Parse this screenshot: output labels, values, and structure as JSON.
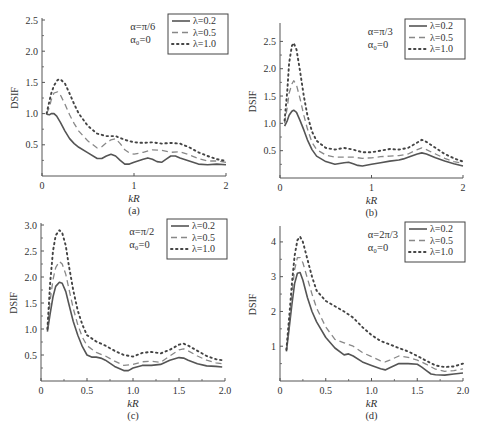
{
  "figure": {
    "background": "#ffffff",
    "axis_color": "#555555",
    "text_color": "#333333",
    "series_styles": [
      {
        "name": "λ=0.2",
        "color": "#555555",
        "dash": "",
        "width": 1.6
      },
      {
        "name": "λ=0.5",
        "color": "#888888",
        "dash": "6 4",
        "width": 1.3
      },
      {
        "name": "λ=1.0",
        "color": "#444444",
        "dash": "1.5 3.5",
        "width": 1.9
      }
    ]
  },
  "chart_data": [
    {
      "type": "line",
      "panel_label": "(a)",
      "title": "",
      "annotation": [
        "α=π/6",
        "α₀=0"
      ],
      "xlabel": "kR",
      "ylabel": "DSIF",
      "xlim": [
        0,
        2
      ],
      "ylim": [
        0,
        2.5
      ],
      "xticks": [
        0,
        1,
        2
      ],
      "xticklabels": [
        "0",
        "1",
        "2"
      ],
      "xminorticks": [],
      "yticks": [
        0.5,
        1.0,
        1.5,
        2.0,
        2.5
      ],
      "yticklabels": [
        "0.5",
        "1.0",
        "1.5",
        "2.0",
        "2.5"
      ],
      "show_y_zero_label": false,
      "grid": false,
      "legend_position": "upper right",
      "box": {
        "x": 42,
        "y": 20,
        "w": 184,
        "h": 156
      },
      "series": [
        {
          "name": "λ=0.2",
          "x": [
            0.05,
            0.08,
            0.1,
            0.13,
            0.16,
            0.2,
            0.25,
            0.3,
            0.35,
            0.4,
            0.5,
            0.6,
            0.65,
            0.7,
            0.75,
            0.8,
            0.85,
            0.9,
            0.95,
            1.0,
            1.1,
            1.15,
            1.2,
            1.25,
            1.3,
            1.35,
            1.4,
            1.45,
            1.5,
            1.6,
            1.7,
            1.8,
            1.9,
            2.0
          ],
          "y": [
            0.99,
            0.98,
            1.0,
            1.0,
            0.96,
            0.86,
            0.72,
            0.6,
            0.52,
            0.46,
            0.37,
            0.28,
            0.28,
            0.32,
            0.35,
            0.32,
            0.25,
            0.19,
            0.19,
            0.22,
            0.27,
            0.29,
            0.27,
            0.23,
            0.22,
            0.27,
            0.32,
            0.32,
            0.29,
            0.24,
            0.19,
            0.18,
            0.19,
            0.18
          ]
        },
        {
          "name": "λ=0.5",
          "x": [
            0.05,
            0.08,
            0.1,
            0.13,
            0.17,
            0.2,
            0.25,
            0.3,
            0.35,
            0.4,
            0.5,
            0.6,
            0.65,
            0.7,
            0.75,
            0.8,
            0.85,
            0.9,
            0.95,
            1.0,
            1.1,
            1.2,
            1.3,
            1.4,
            1.5,
            1.6,
            1.7,
            1.8,
            1.9,
            2.0
          ],
          "y": [
            1.0,
            1.1,
            1.22,
            1.33,
            1.35,
            1.3,
            1.15,
            0.98,
            0.84,
            0.72,
            0.56,
            0.45,
            0.47,
            0.53,
            0.58,
            0.6,
            0.52,
            0.42,
            0.37,
            0.35,
            0.38,
            0.42,
            0.41,
            0.38,
            0.39,
            0.34,
            0.28,
            0.24,
            0.24,
            0.22
          ]
        },
        {
          "name": "λ=1.0",
          "x": [
            0.05,
            0.08,
            0.1,
            0.13,
            0.17,
            0.2,
            0.25,
            0.3,
            0.35,
            0.4,
            0.5,
            0.6,
            0.7,
            0.8,
            0.9,
            1.0,
            1.1,
            1.2,
            1.3,
            1.4,
            1.5,
            1.6,
            1.7,
            1.8,
            1.9,
            2.0
          ],
          "y": [
            1.0,
            1.2,
            1.32,
            1.45,
            1.54,
            1.55,
            1.48,
            1.32,
            1.15,
            1.0,
            0.8,
            0.68,
            0.64,
            0.64,
            0.58,
            0.54,
            0.53,
            0.54,
            0.52,
            0.53,
            0.52,
            0.46,
            0.38,
            0.32,
            0.27,
            0.24
          ]
        }
      ]
    },
    {
      "type": "line",
      "panel_label": "(b)",
      "title": "",
      "annotation": [
        "α=π/3",
        "α₀=0"
      ],
      "xlabel": "kR",
      "ylabel": "DSIF",
      "xlim": [
        0,
        2
      ],
      "ylim": [
        0,
        2.8
      ],
      "xticks": [
        0,
        1,
        2
      ],
      "xticklabels": [
        "0",
        "1",
        "2"
      ],
      "xminorticks": [],
      "yticks": [
        0.5,
        1.0,
        1.5,
        2.0,
        2.5
      ],
      "yticklabels": [
        "0.5",
        "1.0",
        "1.5",
        "2.0",
        "2.5"
      ],
      "show_y_zero_label": false,
      "grid": false,
      "legend_position": "upper right",
      "box": {
        "x": 280,
        "y": 25,
        "w": 183,
        "h": 153
      },
      "series": [
        {
          "name": "λ=0.2",
          "x": [
            0.05,
            0.08,
            0.1,
            0.13,
            0.15,
            0.18,
            0.22,
            0.26,
            0.3,
            0.35,
            0.4,
            0.5,
            0.6,
            0.7,
            0.75,
            0.8,
            0.85,
            0.9,
            1.0,
            1.1,
            1.2,
            1.3,
            1.35,
            1.4,
            1.5,
            1.55,
            1.6,
            1.7,
            1.8,
            1.9,
            2.0
          ],
          "y": [
            0.95,
            1.05,
            1.15,
            1.22,
            1.24,
            1.2,
            1.05,
            0.88,
            0.7,
            0.52,
            0.4,
            0.3,
            0.25,
            0.28,
            0.29,
            0.26,
            0.23,
            0.22,
            0.25,
            0.28,
            0.31,
            0.33,
            0.35,
            0.38,
            0.44,
            0.46,
            0.44,
            0.37,
            0.31,
            0.26,
            0.22
          ]
        },
        {
          "name": "λ=0.5",
          "x": [
            0.05,
            0.08,
            0.1,
            0.13,
            0.15,
            0.18,
            0.22,
            0.26,
            0.3,
            0.35,
            0.4,
            0.5,
            0.6,
            0.7,
            0.8,
            0.9,
            1.0,
            1.1,
            1.2,
            1.3,
            1.4,
            1.5,
            1.55,
            1.6,
            1.7,
            1.8,
            1.9,
            2.0
          ],
          "y": [
            1.0,
            1.3,
            1.55,
            1.72,
            1.78,
            1.7,
            1.45,
            1.15,
            0.9,
            0.65,
            0.52,
            0.42,
            0.38,
            0.38,
            0.38,
            0.36,
            0.37,
            0.39,
            0.4,
            0.41,
            0.44,
            0.52,
            0.55,
            0.52,
            0.44,
            0.36,
            0.3,
            0.27
          ]
        },
        {
          "name": "λ=1.0",
          "x": [
            0.05,
            0.08,
            0.1,
            0.13,
            0.15,
            0.18,
            0.22,
            0.26,
            0.3,
            0.35,
            0.4,
            0.5,
            0.6,
            0.7,
            0.8,
            0.9,
            1.0,
            1.1,
            1.2,
            1.3,
            1.4,
            1.5,
            1.55,
            1.6,
            1.7,
            1.8,
            1.9,
            2.0
          ],
          "y": [
            1.05,
            1.6,
            2.1,
            2.42,
            2.47,
            2.35,
            1.95,
            1.5,
            1.15,
            0.85,
            0.68,
            0.55,
            0.52,
            0.55,
            0.52,
            0.47,
            0.47,
            0.5,
            0.53,
            0.52,
            0.55,
            0.65,
            0.7,
            0.66,
            0.55,
            0.44,
            0.36,
            0.3
          ]
        }
      ]
    },
    {
      "type": "line",
      "panel_label": "(c)",
      "title": "",
      "annotation": [
        "α=π/2",
        "α₀=0"
      ],
      "xlabel": "kR",
      "ylabel": "DSIF",
      "xlim": [
        0,
        2.0
      ],
      "ylim": [
        0,
        3.0
      ],
      "xticks": [
        0,
        0.5,
        1.0,
        1.5,
        2.0
      ],
      "xticklabels": [
        "0",
        "0.5",
        "1.0",
        "1.5",
        "2.0"
      ],
      "xminorticks": [
        0.25,
        0.75,
        1.25,
        1.75
      ],
      "yticks": [
        0.5,
        1.0,
        1.5,
        2.0,
        2.5,
        3.0
      ],
      "yticklabels": [
        "0.5",
        "1.0",
        "1.5",
        "2.0",
        "2.5",
        "3.0"
      ],
      "show_y_zero_label": true,
      "y_zero_label": "0",
      "grid": false,
      "legend_position": "upper right",
      "box": {
        "x": 41,
        "y": 225,
        "w": 184,
        "h": 156
      },
      "series": [
        {
          "name": "λ=0.2",
          "x": [
            0.07,
            0.1,
            0.13,
            0.16,
            0.2,
            0.23,
            0.27,
            0.3,
            0.35,
            0.4,
            0.45,
            0.5,
            0.55,
            0.6,
            0.65,
            0.7,
            0.8,
            0.9,
            0.95,
            1.0,
            1.1,
            1.2,
            1.3,
            1.4,
            1.5,
            1.55,
            1.6,
            1.7,
            1.8,
            1.9,
            1.97
          ],
          "y": [
            0.95,
            1.3,
            1.62,
            1.82,
            1.9,
            1.88,
            1.72,
            1.5,
            1.15,
            0.88,
            0.66,
            0.5,
            0.46,
            0.46,
            0.44,
            0.4,
            0.28,
            0.2,
            0.2,
            0.25,
            0.3,
            0.3,
            0.32,
            0.4,
            0.45,
            0.44,
            0.4,
            0.33,
            0.29,
            0.28,
            0.27
          ]
        },
        {
          "name": "λ=0.5",
          "x": [
            0.07,
            0.1,
            0.13,
            0.16,
            0.2,
            0.23,
            0.27,
            0.3,
            0.35,
            0.4,
            0.45,
            0.5,
            0.6,
            0.7,
            0.8,
            0.9,
            1.0,
            1.1,
            1.2,
            1.3,
            1.4,
            1.5,
            1.55,
            1.6,
            1.7,
            1.8,
            1.9,
            1.97
          ],
          "y": [
            1.0,
            1.55,
            1.95,
            2.18,
            2.3,
            2.25,
            2.05,
            1.8,
            1.4,
            1.08,
            0.84,
            0.68,
            0.55,
            0.48,
            0.38,
            0.3,
            0.32,
            0.37,
            0.38,
            0.36,
            0.48,
            0.6,
            0.62,
            0.58,
            0.48,
            0.4,
            0.35,
            0.33
          ]
        },
        {
          "name": "λ=1.0",
          "x": [
            0.07,
            0.1,
            0.13,
            0.16,
            0.2,
            0.23,
            0.27,
            0.3,
            0.35,
            0.4,
            0.45,
            0.5,
            0.6,
            0.7,
            0.8,
            0.9,
            1.0,
            1.1,
            1.2,
            1.3,
            1.4,
            1.5,
            1.55,
            1.6,
            1.7,
            1.8,
            1.9,
            1.97
          ],
          "y": [
            1.0,
            1.9,
            2.5,
            2.8,
            2.9,
            2.85,
            2.6,
            2.25,
            1.75,
            1.35,
            1.08,
            0.88,
            0.76,
            0.68,
            0.58,
            0.5,
            0.47,
            0.54,
            0.56,
            0.53,
            0.6,
            0.7,
            0.72,
            0.68,
            0.58,
            0.48,
            0.42,
            0.4
          ]
        }
      ]
    },
    {
      "type": "line",
      "panel_label": "(d)",
      "title": "",
      "annotation": [
        "α=2π/3",
        "α₀=0"
      ],
      "xlabel": "kR",
      "ylabel": "DSIF",
      "xlim": [
        0,
        2.0
      ],
      "ylim": [
        0,
        4.4
      ],
      "xticks": [
        0,
        0.5,
        1.0,
        1.5,
        2.0
      ],
      "xticklabels": [
        "0",
        "0.5",
        "1.0",
        "1.5",
        "2.0"
      ],
      "xminorticks": [
        0.25,
        0.75,
        1.25,
        1.75
      ],
      "yticks": [
        1,
        2,
        3,
        4
      ],
      "yticklabels": [
        "1",
        "2",
        "3",
        "4"
      ],
      "show_y_zero_label": true,
      "y_zero_label": "0",
      "grid": false,
      "legend_position": "upper right",
      "box": {
        "x": 280,
        "y": 228,
        "w": 183,
        "h": 153
      },
      "series": [
        {
          "name": "λ=0.2",
          "x": [
            0.07,
            0.1,
            0.13,
            0.16,
            0.19,
            0.22,
            0.25,
            0.3,
            0.35,
            0.4,
            0.5,
            0.6,
            0.7,
            0.75,
            0.8,
            0.9,
            1.0,
            1.1,
            1.15,
            1.2,
            1.3,
            1.4,
            1.5,
            1.55,
            1.6,
            1.65,
            1.7,
            1.8,
            1.9,
            2.0
          ],
          "y": [
            0.85,
            1.5,
            2.2,
            2.8,
            3.1,
            3.12,
            2.9,
            2.4,
            2.0,
            1.7,
            1.25,
            0.95,
            0.75,
            0.78,
            0.72,
            0.55,
            0.45,
            0.35,
            0.32,
            0.38,
            0.5,
            0.5,
            0.48,
            0.4,
            0.3,
            0.2,
            0.18,
            0.17,
            0.2,
            0.23
          ]
        },
        {
          "name": "λ=0.5",
          "x": [
            0.07,
            0.1,
            0.13,
            0.16,
            0.19,
            0.22,
            0.25,
            0.3,
            0.35,
            0.4,
            0.5,
            0.6,
            0.7,
            0.8,
            0.9,
            1.0,
            1.1,
            1.15,
            1.2,
            1.3,
            1.4,
            1.5,
            1.6,
            1.7,
            1.8,
            1.9,
            2.0
          ],
          "y": [
            0.9,
            1.7,
            2.5,
            3.2,
            3.55,
            3.55,
            3.4,
            2.95,
            2.5,
            2.1,
            1.55,
            1.2,
            1.1,
            1.0,
            0.82,
            0.7,
            0.58,
            0.55,
            0.6,
            0.72,
            0.68,
            0.6,
            0.48,
            0.34,
            0.28,
            0.3,
            0.35
          ]
        },
        {
          "name": "λ=1.0",
          "x": [
            0.07,
            0.1,
            0.13,
            0.16,
            0.19,
            0.22,
            0.25,
            0.3,
            0.35,
            0.4,
            0.5,
            0.6,
            0.7,
            0.8,
            0.9,
            1.0,
            1.1,
            1.2,
            1.3,
            1.4,
            1.5,
            1.6,
            1.7,
            1.8,
            1.9,
            2.0
          ],
          "y": [
            0.9,
            1.8,
            2.8,
            3.6,
            4.05,
            4.15,
            4.0,
            3.5,
            3.0,
            2.6,
            2.3,
            2.15,
            2.0,
            1.82,
            1.55,
            1.32,
            1.15,
            1.05,
            0.95,
            0.85,
            0.72,
            0.58,
            0.45,
            0.4,
            0.42,
            0.5
          ]
        }
      ]
    }
  ]
}
